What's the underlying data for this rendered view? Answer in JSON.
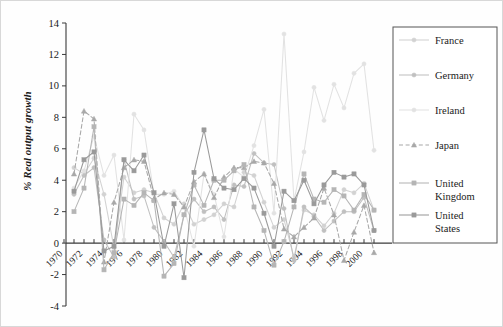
{
  "chart_data": {
    "type": "line",
    "title": "",
    "xlabel": "",
    "ylabel": "% Real output growth",
    "xlim": [
      1970,
      2002
    ],
    "ylim": [
      -4,
      14
    ],
    "ytick_labels": [
      "14",
      "12",
      "10",
      "8",
      "6",
      "4",
      "2",
      "0",
      "-2",
      "-4"
    ],
    "ytick_values": [
      14,
      12,
      10,
      8,
      6,
      4,
      2,
      0,
      -2,
      -4
    ],
    "xtick_labels": [
      "1970",
      "1972",
      "1974",
      "1976",
      "1978",
      "1980",
      "1982",
      "1984",
      "1986",
      "1988",
      "1990",
      "1992",
      "1994",
      "1996",
      "1998",
      "2000"
    ],
    "xtick_values": [
      1970,
      1972,
      1974,
      1976,
      1978,
      1980,
      1982,
      1984,
      1986,
      1988,
      1990,
      1992,
      1994,
      1996,
      1998,
      2000
    ],
    "minor_xticks": [
      1971,
      1973,
      1975,
      1977,
      1979,
      1981,
      1983,
      1985,
      1987,
      1989,
      1991,
      1993,
      1995,
      1997,
      1999,
      2001
    ],
    "grid": false,
    "legend_position": "right",
    "x": [
      1971,
      1972,
      1973,
      1974,
      1975,
      1976,
      1977,
      1978,
      1979,
      1980,
      1981,
      1982,
      1983,
      1984,
      1985,
      1986,
      1987,
      1988,
      1989,
      1990,
      1991,
      1992,
      1993,
      1994,
      1995,
      1996,
      1997,
      1998,
      1999,
      2000,
      2001
    ],
    "series": [
      {
        "name": "France",
        "color": "#d2d2d2",
        "marker": "circle",
        "dash": "solid",
        "values": [
          4.8,
          4.4,
          5.4,
          3.1,
          -0.3,
          4.2,
          3.2,
          3.4,
          3.2,
          1.6,
          1.2,
          2.5,
          1.2,
          1.5,
          1.8,
          2.5,
          2.3,
          4.5,
          4.3,
          2.6,
          1.0,
          1.5,
          -0.9,
          2.1,
          1.8,
          1.1,
          1.9,
          3.4,
          3.2,
          3.8,
          2.1
        ]
      },
      {
        "name": "Germany",
        "color": "#c0c0c0",
        "marker": "circle",
        "dash": "solid",
        "values": [
          3.1,
          4.3,
          4.8,
          0.2,
          -0.9,
          5.3,
          2.8,
          3.0,
          1.0,
          0.1,
          -0.9,
          1.8,
          2.8,
          2.0,
          2.3,
          1.5,
          3.7,
          3.6,
          5.7,
          5.1,
          5.0,
          2.2,
          -1.1,
          2.3,
          1.7,
          0.8,
          1.4,
          2.0,
          2.0,
          2.9,
          0.8
        ]
      },
      {
        "name": "Ireland",
        "color": "#e2e2e2",
        "marker": "circle",
        "dash": "solid",
        "values": [
          3.5,
          4.6,
          6.8,
          4.3,
          5.6,
          0.2,
          8.2,
          7.2,
          3.1,
          3.1,
          3.3,
          2.3,
          -0.2,
          4.4,
          3.1,
          0.4,
          4.7,
          4.2,
          6.2,
          8.5,
          1.9,
          13.3,
          2.7,
          5.8,
          9.9,
          7.8,
          10.1,
          8.6,
          10.8,
          11.4,
          5.9
        ]
      },
      {
        "name": "Japan",
        "color": "#a8a8a8",
        "marker": "triangle",
        "dash": "dashed",
        "values": [
          4.4,
          8.4,
          7.9,
          -1.2,
          2.6,
          4.8,
          5.3,
          5.2,
          2.8,
          3.2,
          3.1,
          2.3,
          3.9,
          4.4,
          2.9,
          4.2,
          4.8,
          4.8,
          5.2,
          5.1,
          3.8,
          0.9,
          0.4,
          1.0,
          1.6,
          3.5,
          1.8,
          -1.1,
          0.7,
          2.4,
          -0.6
        ]
      },
      {
        "name": "United Kingdom",
        "color": "#b5b5b5",
        "marker": "square",
        "dash": "solid",
        "values": [
          2.0,
          3.5,
          7.4,
          -1.7,
          -0.6,
          2.8,
          2.4,
          3.2,
          2.7,
          -2.1,
          -1.3,
          1.8,
          3.7,
          2.4,
          4.0,
          4.0,
          4.6,
          5.0,
          2.3,
          0.8,
          -1.4,
          0.1,
          2.3,
          4.4,
          2.8,
          2.6,
          3.4,
          3.0,
          2.1,
          3.1,
          2.1
        ]
      },
      {
        "name": "United States",
        "color": "#9a9a9a",
        "marker": "square",
        "dash": "solid",
        "values": [
          3.3,
          5.3,
          5.8,
          -0.5,
          -0.2,
          5.3,
          4.6,
          5.6,
          3.2,
          -0.2,
          2.5,
          -2.2,
          4.5,
          7.2,
          4.1,
          3.5,
          3.4,
          4.1,
          3.5,
          1.9,
          -0.2,
          3.3,
          2.7,
          4.0,
          2.5,
          3.7,
          4.5,
          4.2,
          4.4,
          3.7,
          0.8
        ]
      }
    ],
    "annotations": []
  },
  "legend": {
    "entries": [
      {
        "label": "France"
      },
      {
        "label": "Germany"
      },
      {
        "label": "Ireland"
      },
      {
        "label": "Japan"
      },
      {
        "label": "United Kingdom"
      },
      {
        "label": "United States"
      }
    ]
  }
}
